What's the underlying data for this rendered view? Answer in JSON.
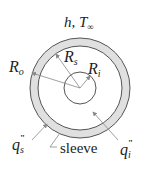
{
  "diagram": {
    "top_label": "h, T∞",
    "labels": {
      "R_o": "R",
      "R_o_sub": "o",
      "R_s": "R",
      "R_s_sub": "s",
      "R_i": "R",
      "R_i_sub": "i",
      "q_s": "q",
      "q_s_sub": "s",
      "q_s_sup": "\"",
      "q_i": "q",
      "q_i_sub": "i",
      "q_i_sup": "\"",
      "sleeve": "sleeve"
    },
    "colors": {
      "sleeve_fill": "#e0e0e0",
      "stroke": "#555555",
      "arrow": "#888888"
    }
  }
}
